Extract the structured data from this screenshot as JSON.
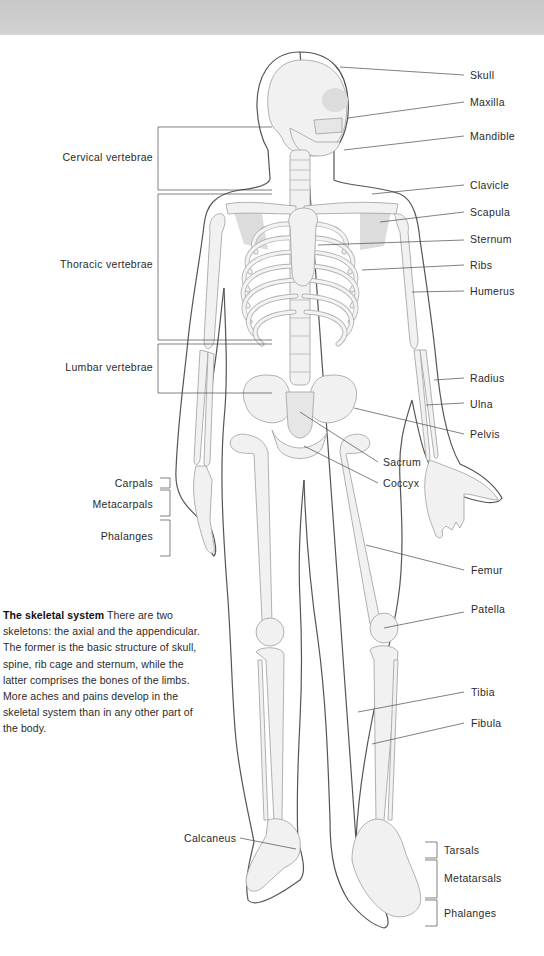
{
  "figure": {
    "title": "The skeletal system",
    "caption_body": "There are two skeletons: the axial and the appendicular. The former is the basic structure of skull, spine, rib cage and sternum, while the latter comprises the bones of the limbs. More aches and pains develop in the skeletal system than in any other part of the body.",
    "colors": {
      "background": "#ffffff",
      "top_band": "#cdcdcd",
      "bone_fill": "#f1f1f1",
      "bone_stroke": "#a8a8a8",
      "body_outline": "#555555",
      "leader_line": "#444444",
      "label_text": "#2a2a2a"
    }
  },
  "labels_right": [
    {
      "id": "skull",
      "text": "Skull"
    },
    {
      "id": "maxilla",
      "text": "Maxilla"
    },
    {
      "id": "mandible",
      "text": "Mandible"
    },
    {
      "id": "clavicle",
      "text": "Clavicle"
    },
    {
      "id": "scapula",
      "text": "Scapula"
    },
    {
      "id": "sternum",
      "text": "Sternum"
    },
    {
      "id": "ribs",
      "text": "Ribs"
    },
    {
      "id": "humerus",
      "text": "Humerus"
    },
    {
      "id": "radius",
      "text": "Radius"
    },
    {
      "id": "ulna",
      "text": "Ulna"
    },
    {
      "id": "pelvis",
      "text": "Pelvis"
    },
    {
      "id": "sacrum",
      "text": "Sacrum"
    },
    {
      "id": "coccyx",
      "text": "Coccyx"
    },
    {
      "id": "femur",
      "text": "Femur"
    },
    {
      "id": "patella",
      "text": "Patella"
    },
    {
      "id": "tibia",
      "text": "Tibia"
    },
    {
      "id": "fibula",
      "text": "Fibula"
    },
    {
      "id": "tarsals",
      "text": "Tarsals"
    },
    {
      "id": "metatarsals",
      "text": "Metatarsals"
    },
    {
      "id": "phalanges_foot",
      "text": "Phalanges"
    }
  ],
  "labels_left": [
    {
      "id": "cervical",
      "text": "Cervical vertebrae"
    },
    {
      "id": "thoracic",
      "text": "Thoracic vertebrae"
    },
    {
      "id": "lumbar",
      "text": "Lumbar vertebrae"
    },
    {
      "id": "carpals",
      "text": "Carpals"
    },
    {
      "id": "metacarpals",
      "text": "Metacarpals"
    },
    {
      "id": "phalanges_hand",
      "text": "Phalanges"
    },
    {
      "id": "calcaneus",
      "text": "Calcaneus"
    }
  ]
}
